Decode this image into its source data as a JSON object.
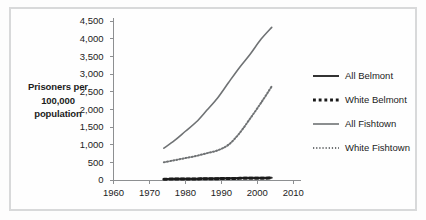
{
  "chart_data": {
    "type": "line",
    "title": "",
    "xlabel": "",
    "ylabel": "Prisoners per 100,000 population",
    "xlim": [
      1960,
      2012
    ],
    "ylim": [
      0,
      4500
    ],
    "grid": false,
    "legend_position": "right",
    "x_ticks": [
      "1960",
      "1970",
      "1980",
      "1990",
      "2000",
      "2010"
    ],
    "x_tick_values": [
      1960,
      1970,
      1980,
      1990,
      2000,
      2010
    ],
    "y_ticks": [
      "0",
      "500",
      "1,000",
      "1,500",
      "2,000",
      "2,500",
      "3,000",
      "3,500",
      "4,000",
      "4,500"
    ],
    "y_tick_values": [
      0,
      500,
      1000,
      1500,
      2000,
      2500,
      3000,
      3500,
      4000,
      4500
    ],
    "x": [
      1974,
      1977,
      1980,
      1983,
      1986,
      1989,
      1992,
      1995,
      1998,
      2001,
      2004
    ],
    "series": [
      {
        "name": "All Belmont",
        "style": "solid",
        "color": "#333333",
        "width": 2.0,
        "values": [
          30,
          32,
          35,
          38,
          42,
          48,
          52,
          58,
          62,
          64,
          66
        ]
      },
      {
        "name": "White Belmont",
        "style": "dotted-thick",
        "color": "#1a1a1a",
        "width": 3.0,
        "values": [
          24,
          26,
          28,
          31,
          34,
          38,
          42,
          46,
          50,
          52,
          54
        ]
      },
      {
        "name": "All Fishtown",
        "style": "solid",
        "color": "#6f7274",
        "width": 1.6,
        "values": [
          900,
          1120,
          1380,
          1640,
          1980,
          2330,
          2760,
          3180,
          3560,
          3980,
          4320
        ]
      },
      {
        "name": "White Fishtown",
        "style": "dotted-fine",
        "color": "#6f7274",
        "width": 2.0,
        "values": [
          500,
          560,
          620,
          680,
          760,
          840,
          1000,
          1320,
          1740,
          2180,
          2650
        ]
      }
    ]
  },
  "y_axis_caption": {
    "line1": "Prisoners per",
    "line2": "100,000",
    "line3": "population"
  },
  "legend": {
    "items": [
      {
        "label": "All Belmont"
      },
      {
        "label": "White Belmont"
      },
      {
        "label": "All Fishtown"
      },
      {
        "label": "White Fishtown"
      }
    ]
  }
}
